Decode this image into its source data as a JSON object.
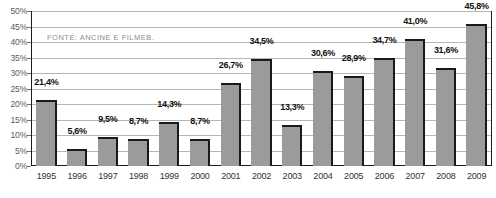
{
  "chart_data": {
    "type": "bar",
    "title": "",
    "subtitle": "",
    "xlabel": "",
    "ylabel": "",
    "categories": [
      "1995",
      "1996",
      "1997",
      "1998",
      "1999",
      "2000",
      "2001",
      "2002",
      "2003",
      "2004",
      "2005",
      "2006",
      "2007",
      "2008",
      "2009"
    ],
    "values": [
      21.4,
      5.6,
      9.5,
      8.7,
      14.3,
      8.7,
      26.7,
      34.5,
      13.3,
      30.6,
      28.9,
      34.7,
      41.0,
      31.6,
      45.8
    ],
    "value_labels": [
      "21,4%",
      "5,6%",
      "9,5%",
      "8,7%",
      "14,3%",
      "8,7%",
      "26,7%",
      "34,5%",
      "13,3%",
      "30,6%",
      "28,9%",
      "34,7%",
      "41,0%",
      "31,6%",
      "45,8%"
    ],
    "ylim": [
      0,
      50
    ],
    "ytick_values": [
      0,
      5,
      10,
      15,
      20,
      25,
      30,
      35,
      40,
      45,
      50
    ],
    "ytick_labels": [
      "0%",
      "5%",
      "10%",
      "15%",
      "20%",
      "25%",
      "30%",
      "35%",
      "40%",
      "45%",
      "50%"
    ],
    "grid": true,
    "legend": "none",
    "annotations": [
      "FONTE: ANCINE E FILMEB."
    ],
    "decimal_separator": ",",
    "series_name": ""
  },
  "notes": {
    "source": "FONTE: ANCINE E FILMEB."
  },
  "colors": {
    "bar_fill": "#9b9b9b",
    "bar_edge": "#1a1a1a",
    "gridline": "#b5b5b5",
    "frame": "#1c1c1c",
    "label_text": "#111111",
    "axis_text": "#5a5a5a",
    "source_text": "#8d8d8d",
    "background": "#ffffff"
  }
}
